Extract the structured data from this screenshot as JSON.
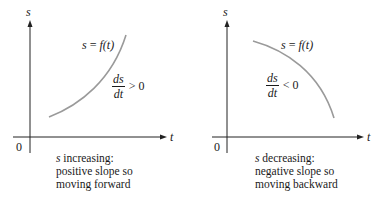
{
  "panels": [
    {
      "id": "increasing",
      "axis_labels": {
        "y": "s",
        "x": "t",
        "origin": "0"
      },
      "curve_label": {
        "lhs": "s",
        "eq": " = ",
        "fn": "f",
        "arg": "(t)"
      },
      "derivative": {
        "numerator": "ds",
        "denominator": "dt",
        "relation": ">",
        "value": "0"
      },
      "caption": {
        "line1_var": "s",
        "line1_rest": " increasing:",
        "line2": "positive slope so",
        "line3": "moving forward"
      }
    },
    {
      "id": "decreasing",
      "axis_labels": {
        "y": "s",
        "x": "t",
        "origin": "0"
      },
      "curve_label": {
        "lhs": "s",
        "eq": " = ",
        "fn": "f",
        "arg": "(t)"
      },
      "derivative": {
        "numerator": "ds",
        "denominator": "dt",
        "relation": "<",
        "value": "0"
      },
      "caption": {
        "line1_var": "s",
        "line1_rest": " decreasing:",
        "line2": "negative slope so",
        "line3": "moving backward"
      }
    }
  ],
  "colors": {
    "axis": "#222222",
    "curve": "#9a9a9a",
    "text": "#1a1a1a",
    "background": "#ffffff"
  }
}
